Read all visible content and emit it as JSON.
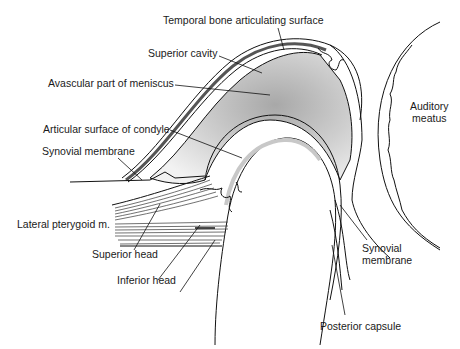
{
  "figure": {
    "labels": {
      "temporal_bone": "Temporal bone articulating surface",
      "superior_cavity": "Superior cavity",
      "avascular_meniscus": "Avascular part of meniscus",
      "articular_condyle": "Articular surface of condyle",
      "synovial_membrane_left": "Synovial membrane",
      "lateral_pterygoid": "Lateral pterygoid m.",
      "superior_head": "Superior head",
      "inferior_head": "Inferior head",
      "auditory_meatus_line1": "Auditory",
      "auditory_meatus_line2": "meatus",
      "synovial_membrane_right_line1": "Synovial",
      "synovial_membrane_right_line2": "membrane",
      "posterior_capsule": "Posterior capsule"
    }
  }
}
